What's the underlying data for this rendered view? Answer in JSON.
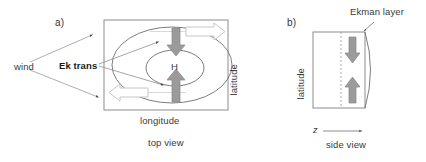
{
  "figure": {
    "panels": [
      {
        "id": "a",
        "tag": "a)",
        "caption": "top view",
        "axis_x_label": "longitude",
        "axis_y_label": "latitude",
        "center_label": "H",
        "annotations": [
          {
            "name": "wind",
            "text": "wind",
            "bold": false
          },
          {
            "name": "ekman-transport",
            "text": "Ek trans",
            "bold": true
          }
        ]
      },
      {
        "id": "b",
        "tag": "b)",
        "caption": "side view",
        "axis_x_label": "z",
        "axis_y_label": "latitude",
        "annotations": [
          {
            "name": "ekman-layer",
            "text": "Ekman layer",
            "bold": false
          }
        ]
      }
    ],
    "colors": {
      "arrow_fill": "#9b9b9b",
      "arrow_stroke": "#7d7d7d",
      "hollow_arrow_stroke": "#c8c8c8",
      "line": "#6e6e6e",
      "box": "#8c8c8c",
      "text": "#3a3a3a",
      "background": "#ffffff"
    }
  }
}
